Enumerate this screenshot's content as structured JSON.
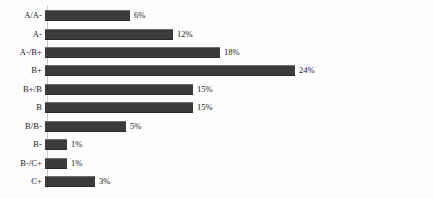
{
  "chart_data": {
    "type": "bar",
    "orientation": "horizontal",
    "title": "",
    "subtitle": "",
    "xlabel": "",
    "ylabel": "",
    "categories": [
      "A/A-",
      "A-",
      "A-/B+",
      "B+",
      "B+/B",
      "B",
      "B/B-",
      "B-",
      "B-/C+",
      "C+"
    ],
    "values": [
      6,
      12,
      18,
      24,
      15,
      15,
      5,
      1,
      1,
      3
    ],
    "value_labels": [
      "6%",
      "12%",
      "18%",
      "24%",
      "15%",
      "15%",
      "5%",
      "1%",
      "1%",
      "3%"
    ],
    "units": "percent",
    "xlim": [
      0,
      24
    ],
    "grid": false,
    "legend": null,
    "bar_color": "#3b3b3b",
    "pixel_widths": [
      85,
      128,
      175,
      250,
      148,
      148,
      81,
      22,
      22,
      50
    ]
  },
  "bars": [
    {
      "label": "A/A-",
      "value_label": "6%",
      "width_px": 85,
      "top_px": 7
    },
    {
      "label": "A-",
      "value_label": "12%",
      "width_px": 128,
      "top_px": 26
    },
    {
      "label": "A-/B+",
      "value_label": "18%",
      "width_px": 175,
      "top_px": 44
    },
    {
      "label": "B+",
      "value_label": "24%",
      "width_px": 250,
      "top_px": 62
    },
    {
      "label": "B+/B",
      "value_label": "15%",
      "width_px": 148,
      "top_px": 81
    },
    {
      "label": "B",
      "value_label": "15%",
      "width_px": 148,
      "top_px": 99
    },
    {
      "label": "B/B-",
      "value_label": "5%",
      "width_px": 81,
      "top_px": 118
    },
    {
      "label": "B-",
      "value_label": "1%",
      "width_px": 22,
      "top_px": 136
    },
    {
      "label": "B-/C+",
      "value_label": "1%",
      "width_px": 22,
      "top_px": 155
    },
    {
      "label": "C+",
      "value_label": "3%",
      "width_px": 50,
      "top_px": 173
    }
  ]
}
